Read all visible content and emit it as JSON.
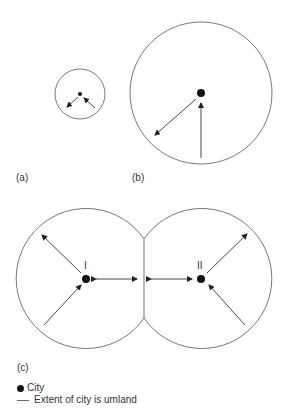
{
  "panels": {
    "a": {
      "label": "(a)"
    },
    "b": {
      "label": "(b)"
    },
    "c": {
      "label": "(c)",
      "city_labels": [
        "I",
        "II"
      ]
    }
  },
  "legend": {
    "items": [
      {
        "symbol": "dot",
        "label": "City"
      },
      {
        "symbol": "line",
        "label": "Extent of city is umland"
      }
    ]
  },
  "colors": {
    "stroke": "#555555",
    "city": "#111111"
  }
}
